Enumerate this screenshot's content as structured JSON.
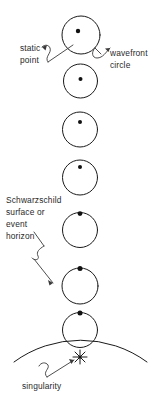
{
  "figure": {
    "background_color": "#ffffff",
    "ink_color": "#1a1a1a",
    "text_color": "#2a2a2a",
    "width": 163,
    "height": 397
  },
  "labels": {
    "static_point": {
      "line1": "static",
      "line2": "point"
    },
    "wavefront_circle": {
      "line1": "wavefront",
      "line2": "circle"
    },
    "schwarzschild": {
      "line1": "Schwarzschild",
      "line2": "surface or",
      "line3": "event",
      "line4": "horizon"
    },
    "singularity": {
      "line1": "singularity"
    }
  },
  "diagram": {
    "wavefront_circles": [
      {
        "index": 1,
        "cx": 81,
        "cy": 35,
        "r": 19,
        "dot_cx": 78,
        "dot_cy": 31,
        "dot_r": 2.2,
        "note": "dot near center, slightly up-left"
      },
      {
        "index": 2,
        "cx": 80.5,
        "cy": 81,
        "r": 17,
        "dot_cx": 80.5,
        "dot_cy": 79,
        "dot_r": 2.0,
        "note": "dot at center"
      },
      {
        "index": 3,
        "cx": 80,
        "cy": 129.5,
        "r": 17.5,
        "dot_cx": 80,
        "dot_cy": 122,
        "dot_r": 2.0,
        "note": "dot above center"
      },
      {
        "index": 4,
        "cx": 80,
        "cy": 177.5,
        "r": 17.5,
        "dot_cx": 80,
        "dot_cy": 167,
        "dot_r": 2.0,
        "note": "dot high in circle"
      },
      {
        "index": 5,
        "cx": 80,
        "cy": 230,
        "r": 17.5,
        "dot_cx": 80,
        "dot_cy": 214,
        "dot_r": 2.2,
        "note": "dot at top rim"
      },
      {
        "index": 6,
        "cx": 80,
        "cy": 285,
        "r": 18,
        "dot_cx": 80,
        "dot_cy": 268,
        "dot_r": 2.4,
        "note": "tangent below horizon, dot on horizon"
      },
      {
        "index": 7,
        "cx": 80,
        "cy": 330,
        "r": 17.5,
        "dot_cx": 80,
        "dot_cy": 313,
        "dot_r": 2.4,
        "note": "dot at top rim, inside horizon"
      }
    ],
    "event_horizon": {
      "cx": 80,
      "cy": 380,
      "r": 112,
      "apex_y": 268,
      "left_x": 14,
      "right_x": 147,
      "type": "large-arc"
    },
    "singularity_marker": {
      "cx": 80,
      "cy": 357,
      "rays": 8,
      "ray_length": 7,
      "glyph": "asterisk"
    }
  }
}
